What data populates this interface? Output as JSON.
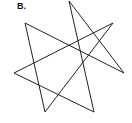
{
  "figure": {
    "label": "B.",
    "shape": "heptagram {7/2}",
    "stroke_color": "#222222",
    "stroke_width": 1,
    "fill": "none",
    "vertices": [
      {
        "name": "top",
        "x": 69,
        "y": 1
      },
      {
        "name": "upper-right",
        "x": 113,
        "y": 23
      },
      {
        "name": "right",
        "x": 124,
        "y": 73
      },
      {
        "name": "bottom-right",
        "x": 94,
        "y": 112
      },
      {
        "name": "bottom-left",
        "x": 45,
        "y": 112
      },
      {
        "name": "left",
        "x": 14,
        "y": 73
      },
      {
        "name": "upper-left",
        "x": 25,
        "y": 23
      }
    ],
    "path_order": [
      0,
      3,
      5,
      1,
      4,
      6,
      2,
      0
    ]
  }
}
